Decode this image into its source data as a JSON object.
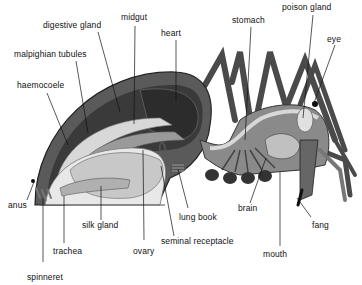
{
  "diagram": {
    "colors": {
      "background": "#ffffff",
      "label_text": "#111111",
      "leader_line": "#111111",
      "dark_tissue": "#3a3a3a",
      "mid_tissue": "#8a8a8a",
      "light_tissue": "#d8d8d8"
    },
    "labels": {
      "digestive_gland": "digestive gland",
      "midgut": "midgut",
      "heart": "heart",
      "stomach": "stomach",
      "poison_gland": "poison gland",
      "eye": "eye",
      "malpighian_tubules": "malpighian tubules",
      "haemocoele": "haemocoele",
      "anus": "anus",
      "silk_gland": "silk gland",
      "trachea": "trachea",
      "spinneret": "spinneret",
      "ovary": "ovary",
      "seminal_receptacle": "seminal receptacle",
      "lung_book": "lung book",
      "brain": "brain",
      "mouth": "mouth",
      "fang": "fang"
    }
  }
}
